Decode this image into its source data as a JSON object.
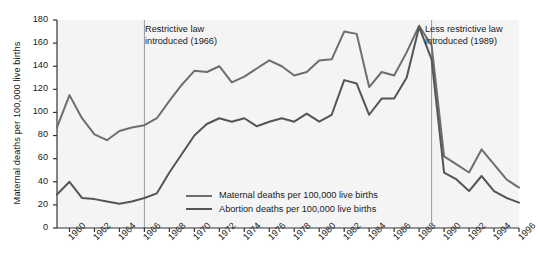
{
  "chart_data": {
    "type": "line",
    "title": "",
    "xlabel": "",
    "ylabel": "Maternal deaths per 100,000 live births",
    "ylim": [
      0,
      180
    ],
    "xlim": [
      1959,
      1996
    ],
    "yticks": [
      0,
      20,
      40,
      60,
      80,
      100,
      120,
      140,
      160,
      180
    ],
    "xticks": [
      1960,
      1962,
      1964,
      1966,
      1968,
      1970,
      1972,
      1974,
      1976,
      1978,
      1980,
      1982,
      1984,
      1986,
      1988,
      1990,
      1992,
      1994,
      1996
    ],
    "grid": false,
    "legend_position": "inside-bottom-center",
    "x": [
      1959,
      1960,
      1961,
      1962,
      1963,
      1964,
      1965,
      1966,
      1967,
      1968,
      1969,
      1970,
      1971,
      1972,
      1973,
      1974,
      1975,
      1976,
      1977,
      1978,
      1979,
      1980,
      1981,
      1982,
      1983,
      1984,
      1985,
      1986,
      1987,
      1988,
      1989,
      1990,
      1991,
      1992,
      1993,
      1994,
      1995,
      1996
    ],
    "series": [
      {
        "name": "Maternal deaths per 100,000 live births",
        "color": "#6e6e6e",
        "values": [
          87,
          115,
          95,
          81,
          76,
          84,
          87,
          89,
          95,
          110,
          124,
          136,
          135,
          140,
          126,
          131,
          138,
          145,
          140,
          132,
          135,
          145,
          146,
          170,
          168,
          122,
          135,
          132,
          152,
          175,
          158,
          62,
          55,
          48,
          68,
          55,
          42,
          35
        ]
      },
      {
        "name": "Abortion deaths per 100,000 live births",
        "color": "#555555",
        "values": [
          29,
          40,
          26,
          25,
          23,
          21,
          23,
          26,
          30,
          48,
          64,
          80,
          90,
          95,
          92,
          95,
          88,
          92,
          95,
          92,
          99,
          92,
          98,
          128,
          125,
          98,
          112,
          112,
          130,
          174,
          146,
          48,
          42,
          32,
          45,
          32,
          26,
          22
        ]
      }
    ],
    "reference_lines": [
      {
        "x": 1966,
        "label": "Restrictive law\nintroduced (1966)"
      },
      {
        "x": 1989,
        "label": "Less restrictive law\nintroduced (1989)"
      }
    ],
    "annotations": [
      {
        "name": "restrictive-law-annotation",
        "line1": "Restrictive law",
        "line2": "introduced (1966)"
      },
      {
        "name": "less-restrictive-law-annotation",
        "line1": "Less restrictive law",
        "line2": "introduced (1989)"
      }
    ],
    "legend": [
      {
        "label": "Maternal deaths per 100,000 live births",
        "color": "#6e6e6e"
      },
      {
        "label": "Abortion deaths per 100,000 live births",
        "color": "#555555"
      }
    ],
    "colors": {
      "plot_background": "#f4f4f4",
      "axis": "#333333",
      "text": "#1a1a1a",
      "reference_line": "#999999",
      "series_1": "#6e6e6e",
      "series_2": "#555555"
    }
  }
}
